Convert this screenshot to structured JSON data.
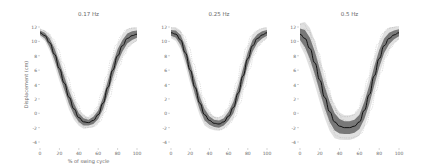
{
  "figure": {
    "ylabel": "Displacement (cm)",
    "xlabel": "% of swing cycle"
  },
  "chart_data": [
    {
      "type": "line",
      "title": "0.17 Hz",
      "xlabel": "% of swing cycle",
      "ylabel": "Displacement (cm)",
      "xlim": [
        0,
        100
      ],
      "ylim": [
        -4,
        12
      ],
      "xticks": [
        0,
        20,
        40,
        60,
        80,
        100
      ],
      "yticks": [
        12,
        10,
        8,
        6,
        4,
        2,
        0,
        -2,
        -4
      ],
      "grid": false,
      "x": [
        0,
        5,
        10,
        15,
        20,
        25,
        30,
        35,
        40,
        45,
        50,
        55,
        60,
        65,
        70,
        75,
        80,
        85,
        90,
        95,
        100
      ],
      "series": [
        {
          "name": "mean",
          "values": [
            11.2,
            10.8,
            9.8,
            8.2,
            6.2,
            4.2,
            2.2,
            0.6,
            -0.6,
            -1.2,
            -1.3,
            -1.0,
            -0.2,
            1.4,
            3.6,
            6.0,
            8.0,
            9.4,
            10.4,
            10.8,
            11.0
          ]
        },
        {
          "name": "sd_band_halfwidth",
          "values": [
            0.3,
            0.4,
            0.6,
            0.8,
            0.9,
            0.9,
            0.9,
            0.8,
            0.6,
            0.5,
            0.4,
            0.5,
            0.6,
            0.8,
            0.9,
            0.9,
            0.9,
            0.8,
            0.7,
            0.6,
            0.5
          ]
        }
      ]
    },
    {
      "type": "line",
      "title": "0.25 Hz",
      "xlabel": "% of swing cycle",
      "ylabel": "Displacement (cm)",
      "xlim": [
        0,
        100
      ],
      "ylim": [
        -4,
        12
      ],
      "xticks": [
        0,
        20,
        40,
        60,
        80,
        100
      ],
      "yticks": [
        12,
        10,
        8,
        6,
        4,
        2,
        0,
        -2,
        -4
      ],
      "grid": false,
      "x": [
        0,
        5,
        10,
        15,
        20,
        25,
        30,
        35,
        40,
        45,
        50,
        55,
        60,
        65,
        70,
        75,
        80,
        85,
        90,
        95,
        100
      ],
      "series": [
        {
          "name": "mean",
          "values": [
            11.2,
            11.0,
            10.2,
            8.4,
            6.0,
            3.6,
            1.4,
            -0.2,
            -1.0,
            -1.4,
            -1.5,
            -1.2,
            -0.4,
            0.8,
            2.8,
            5.2,
            7.6,
            9.4,
            10.4,
            10.9,
            11.2
          ]
        },
        {
          "name": "sd_band_halfwidth",
          "values": [
            0.4,
            0.5,
            0.7,
            0.9,
            1.0,
            1.0,
            0.9,
            0.8,
            0.6,
            0.5,
            0.5,
            0.5,
            0.6,
            0.8,
            0.9,
            1.0,
            0.9,
            0.8,
            0.6,
            0.5,
            0.4
          ]
        }
      ]
    },
    {
      "type": "line",
      "title": "0.5 Hz",
      "xlabel": "% of swing cycle",
      "ylabel": "Displacement (cm)",
      "xlim": [
        0,
        100
      ],
      "ylim": [
        -4,
        12
      ],
      "xticks": [
        0,
        20,
        40,
        60,
        80,
        100
      ],
      "yticks": [
        12,
        10,
        8,
        6,
        4,
        2,
        0,
        -2,
        -4
      ],
      "grid": false,
      "x": [
        0,
        5,
        10,
        15,
        20,
        25,
        30,
        35,
        40,
        45,
        50,
        55,
        60,
        65,
        70,
        75,
        80,
        85,
        90,
        95,
        100
      ],
      "series": [
        {
          "name": "mean",
          "values": [
            11.0,
            10.4,
            9.0,
            7.0,
            4.6,
            2.2,
            0.2,
            -1.2,
            -1.8,
            -2.0,
            -2.0,
            -1.8,
            -1.2,
            0.4,
            2.6,
            5.2,
            7.6,
            9.4,
            10.4,
            10.9,
            11.2
          ]
        },
        {
          "name": "sd_band_halfwidth",
          "values": [
            0.8,
            1.2,
            1.5,
            1.6,
            1.6,
            1.5,
            1.4,
            1.2,
            1.0,
            0.9,
            0.9,
            0.9,
            1.0,
            1.2,
            1.3,
            1.3,
            1.2,
            1.0,
            0.8,
            0.6,
            0.5
          ]
        }
      ]
    }
  ],
  "colors": {
    "mean_line": "#111111",
    "band": "#555555",
    "band_outer": "#bbbbbb",
    "axis_text": "#666666"
  }
}
